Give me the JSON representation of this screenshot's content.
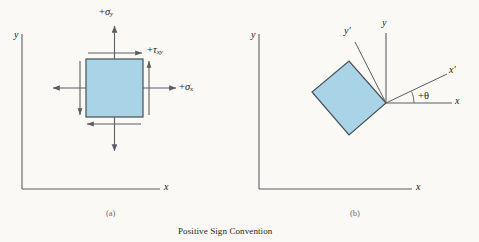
{
  "figure": {
    "caption": "Positive Sign Convention",
    "background_color": "#faf9f6",
    "line_color": "#5a5f63",
    "element_fill": "#a9d4e8",
    "element_stroke": "#4a4f52",
    "text_color": "#1a1a1a"
  },
  "panel_a": {
    "sublabel": "(a)",
    "axis_y_label": "y",
    "axis_x_label": "x",
    "stress_sigma_y": {
      "sign": "+",
      "symbol": "σ",
      "subscript": "y"
    },
    "stress_sigma_x": {
      "sign": "+",
      "symbol": "σ",
      "subscript": "x"
    },
    "stress_tau_xy": {
      "sign": "+",
      "symbol": "τ",
      "subscript": "xy"
    }
  },
  "panel_b": {
    "sublabel": "(b)",
    "axis_y_label": "y",
    "axis_x_label": "x",
    "ref_y_label": "y",
    "ref_x_label": "x",
    "rot_y_label": "y′",
    "rot_x_label": "x′",
    "angle_label": "+θ",
    "rotation_degrees": 25
  }
}
